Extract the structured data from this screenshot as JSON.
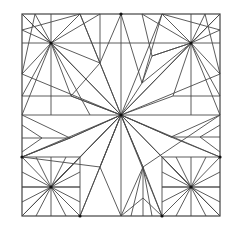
{
  "diagram": {
    "type": "crease-pattern",
    "border": {
      "x": 22,
      "y": 14,
      "w": 198,
      "h": 202
    },
    "line_color": "#4a4a4a",
    "hubs": [
      {
        "name": "center",
        "x": 121,
        "y": 115
      },
      {
        "name": "top-left",
        "x": 51,
        "y": 43
      },
      {
        "name": "top-right",
        "x": 191,
        "y": 43
      },
      {
        "name": "bottom-left",
        "x": 51,
        "y": 187
      },
      {
        "name": "bottom-right",
        "x": 191,
        "y": 187
      },
      {
        "name": "top-mid",
        "x": 121,
        "y": 14
      },
      {
        "name": "bottom-mid-left",
        "x": 80,
        "y": 216
      },
      {
        "name": "bottom-mid-right",
        "x": 162,
        "y": 216
      },
      {
        "name": "left-mid",
        "x": 22,
        "y": 157
      },
      {
        "name": "right-mid",
        "x": 220,
        "y": 157
      }
    ],
    "lines": [
      [
        121,
        14,
        121,
        216
      ],
      [
        22,
        115,
        220,
        115
      ],
      [
        22,
        14,
        220,
        216
      ],
      [
        220,
        14,
        22,
        216
      ],
      [
        121,
        115,
        80,
        14
      ],
      [
        121,
        115,
        162,
        14
      ],
      [
        121,
        115,
        22,
        74
      ],
      [
        121,
        115,
        220,
        74
      ],
      [
        121,
        115,
        51,
        43
      ],
      [
        121,
        115,
        191,
        43
      ],
      [
        121,
        115,
        51,
        187
      ],
      [
        121,
        115,
        191,
        187
      ],
      [
        121,
        115,
        22,
        157
      ],
      [
        121,
        115,
        220,
        157
      ],
      [
        121,
        115,
        80,
        216
      ],
      [
        121,
        115,
        162,
        216
      ],
      [
        121,
        115,
        100,
        63
      ],
      [
        121,
        115,
        142,
        83
      ],
      [
        121,
        115,
        71,
        96
      ],
      [
        121,
        115,
        173,
        96
      ],
      [
        121,
        115,
        70,
        138
      ],
      [
        121,
        115,
        171,
        137
      ],
      [
        121,
        115,
        100,
        167
      ],
      [
        121,
        115,
        143,
        167
      ],
      [
        51,
        14,
        51,
        115
      ],
      [
        22,
        43,
        121,
        43
      ],
      [
        51,
        43,
        22,
        14
      ],
      [
        51,
        43,
        80,
        14
      ],
      [
        51,
        43,
        22,
        74
      ],
      [
        51,
        43,
        100,
        14
      ],
      [
        51,
        43,
        22,
        30
      ],
      [
        51,
        43,
        35,
        14
      ],
      [
        51,
        43,
        71,
        96
      ],
      [
        51,
        43,
        100,
        63
      ],
      [
        51,
        43,
        22,
        96
      ],
      [
        51,
        43,
        22,
        115
      ],
      [
        51,
        43,
        90,
        115
      ],
      [
        22,
        30,
        80,
        14
      ],
      [
        35,
        14,
        22,
        74
      ],
      [
        100,
        14,
        100,
        63
      ],
      [
        100,
        63,
        71,
        96
      ],
      [
        100,
        63,
        80,
        14
      ],
      [
        71,
        96,
        22,
        96
      ],
      [
        71,
        96,
        121,
        115
      ],
      [
        100,
        63,
        121,
        14
      ],
      [
        191,
        14,
        191,
        115
      ],
      [
        121,
        43,
        220,
        43
      ],
      [
        191,
        43,
        220,
        14
      ],
      [
        191,
        43,
        162,
        14
      ],
      [
        191,
        43,
        220,
        74
      ],
      [
        191,
        43,
        142,
        14
      ],
      [
        191,
        43,
        220,
        30
      ],
      [
        191,
        43,
        205,
        14
      ],
      [
        191,
        43,
        173,
        96
      ],
      [
        191,
        43,
        142,
        83
      ],
      [
        191,
        43,
        220,
        96
      ],
      [
        191,
        43,
        220,
        115
      ],
      [
        191,
        43,
        152,
        56
      ],
      [
        220,
        30,
        162,
        14
      ],
      [
        205,
        14,
        220,
        74
      ],
      [
        152,
        56,
        142,
        14
      ],
      [
        152,
        56,
        142,
        83
      ],
      [
        142,
        83,
        121,
        14
      ],
      [
        173,
        96,
        220,
        96
      ],
      [
        152,
        56,
        191,
        43
      ],
      [
        162,
        14,
        142,
        83
      ],
      [
        22,
        187,
        80,
        187
      ],
      [
        80,
        157,
        80,
        216
      ],
      [
        22,
        157,
        80,
        157
      ],
      [
        51,
        187,
        22,
        157
      ],
      [
        51,
        187,
        80,
        216
      ],
      [
        51,
        187,
        22,
        216
      ],
      [
        51,
        187,
        80,
        157
      ],
      [
        51,
        187,
        51,
        216
      ],
      [
        51,
        187,
        51,
        157
      ],
      [
        51,
        187,
        22,
        187
      ],
      [
        51,
        187,
        80,
        187
      ],
      [
        51,
        187,
        36,
        216
      ],
      [
        51,
        187,
        66,
        216
      ],
      [
        51,
        187,
        22,
        172
      ],
      [
        51,
        187,
        22,
        202
      ],
      [
        51,
        187,
        80,
        172
      ],
      [
        51,
        187,
        80,
        202
      ],
      [
        51,
        187,
        66,
        157
      ],
      [
        51,
        187,
        36,
        157
      ],
      [
        51,
        187,
        121,
        115
      ],
      [
        22,
        138,
        70,
        138
      ],
      [
        70,
        138,
        22,
        115
      ],
      [
        70,
        138,
        22,
        157
      ],
      [
        42,
        138,
        22,
        125
      ],
      [
        42,
        138,
        22,
        152
      ],
      [
        22,
        157,
        70,
        138
      ],
      [
        70,
        138,
        121,
        115
      ],
      [
        22,
        157,
        100,
        167
      ],
      [
        162,
        187,
        220,
        187
      ],
      [
        162,
        157,
        162,
        216
      ],
      [
        162,
        157,
        220,
        157
      ],
      [
        191,
        187,
        220,
        157
      ],
      [
        191,
        187,
        162,
        216
      ],
      [
        191,
        187,
        220,
        216
      ],
      [
        191,
        187,
        162,
        157
      ],
      [
        191,
        187,
        191,
        216
      ],
      [
        191,
        187,
        191,
        157
      ],
      [
        191,
        187,
        162,
        187
      ],
      [
        191,
        187,
        220,
        187
      ],
      [
        191,
        187,
        176,
        216
      ],
      [
        191,
        187,
        206,
        216
      ],
      [
        191,
        187,
        220,
        172
      ],
      [
        191,
        187,
        220,
        202
      ],
      [
        191,
        187,
        162,
        172
      ],
      [
        191,
        187,
        162,
        202
      ],
      [
        191,
        187,
        176,
        157
      ],
      [
        191,
        187,
        206,
        157
      ],
      [
        171,
        137,
        220,
        137
      ],
      [
        171,
        137,
        220,
        115
      ],
      [
        171,
        137,
        220,
        157
      ],
      [
        200,
        137,
        220,
        125
      ],
      [
        200,
        137,
        220,
        152
      ],
      [
        171,
        137,
        121,
        115
      ],
      [
        143,
        167,
        143,
        216
      ],
      [
        143,
        167,
        121,
        216
      ],
      [
        143,
        167,
        162,
        216
      ],
      [
        143,
        167,
        131,
        216
      ],
      [
        143,
        167,
        152,
        216
      ],
      [
        143,
        167,
        121,
        115
      ],
      [
        143,
        167,
        220,
        115
      ],
      [
        143,
        198,
        121,
        216
      ],
      [
        143,
        198,
        162,
        216
      ],
      [
        100,
        167,
        121,
        216
      ],
      [
        100,
        167,
        80,
        216
      ],
      [
        100,
        167,
        121,
        115
      ]
    ]
  }
}
